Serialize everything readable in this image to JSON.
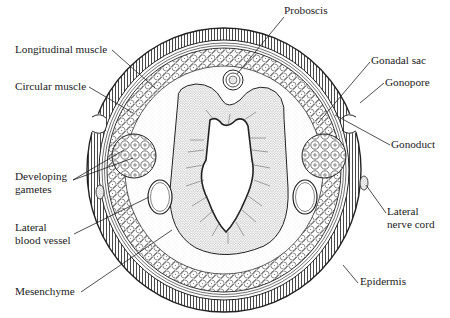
{
  "figure": {
    "type": "cross-section diagram",
    "center": [
      224,
      170
    ],
    "ink_color": "#222222",
    "background": "#ffffff"
  },
  "labels": [
    {
      "id": "proboscis",
      "text": "Proboscis",
      "x": 284,
      "y": 11,
      "line": [
        [
          284,
          17
        ],
        [
          237,
          74
        ]
      ]
    },
    {
      "id": "longitudinal-muscle",
      "text": "Longitudinal muscle",
      "x": 15,
      "y": 43,
      "line": [
        [
          112,
          50
        ],
        [
          155,
          88
        ]
      ]
    },
    {
      "id": "circular-muscle",
      "text": "Circular muscle",
      "x": 15,
      "y": 80,
      "line": [
        [
          89,
          87
        ],
        [
          133,
          113
        ]
      ]
    },
    {
      "id": "gonadal-sac",
      "text": "Gonadal sac",
      "x": 371,
      "y": 54,
      "line": [
        [
          370,
          62
        ],
        [
          318,
          123
        ]
      ]
    },
    {
      "id": "gonopore",
      "text": "Gonopore",
      "x": 385,
      "y": 76,
      "line": [
        [
          384,
          83
        ],
        [
          360,
          103
        ]
      ]
    },
    {
      "id": "gonoduct",
      "text": "Gonoduct",
      "x": 391,
      "y": 140,
      "line": [
        [
          390,
          145
        ],
        [
          335,
          115
        ]
      ]
    },
    {
      "id": "developing-gametes",
      "text": "Developing\ngametes",
      "x": 15,
      "y": 176,
      "lines": [
        [
          [
            73,
            180
          ],
          [
            124,
            150
          ]
        ],
        [
          [
            73,
            180
          ],
          [
            133,
            158
          ]
        ]
      ]
    },
    {
      "id": "lateral-blood-vessel",
      "text": "Lateral\nblood vessel",
      "x": 15,
      "y": 226,
      "line": [
        [
          74,
          234
        ],
        [
          149,
          197
        ]
      ]
    },
    {
      "id": "lateral-nerve-cord",
      "text": "Lateral\nnerve cord",
      "x": 387,
      "y": 210,
      "line": [
        [
          386,
          213
        ],
        [
          366,
          185
        ]
      ]
    },
    {
      "id": "mesenchyme",
      "text": "Mesenchyme",
      "x": 15,
      "y": 285,
      "line": [
        [
          81,
          292
        ],
        [
          172,
          230
        ]
      ]
    },
    {
      "id": "epidermis",
      "text": "Epidermis",
      "x": 360,
      "y": 275,
      "line": [
        [
          358,
          283
        ],
        [
          343,
          265
        ]
      ]
    }
  ],
  "structures": {
    "outer_body": {
      "rx": 137,
      "ry": 142
    },
    "epidermis_band": {
      "rx_in": 125,
      "ry_in": 130
    },
    "circular_muscle_band": {
      "rx_in": 119,
      "ry_in": 124
    },
    "longitudinal_muscle_band": {
      "rx_in": 99,
      "ry_in": 104
    },
    "proboscis": {
      "cx": 233,
      "cy": 80,
      "r": 10
    },
    "gonads": [
      {
        "cx": 134,
        "cy": 156,
        "rx": 22,
        "ry": 22
      },
      {
        "cx": 324,
        "cy": 156,
        "rx": 22,
        "ry": 22
      }
    ],
    "blood_vessels": [
      {
        "cx": 160,
        "cy": 197,
        "rx": 12,
        "ry": 17
      },
      {
        "cx": 305,
        "cy": 197,
        "rx": 12,
        "ry": 17
      }
    ],
    "nerve_cords": [
      {
        "cx": 99,
        "cy": 192
      },
      {
        "cx": 363,
        "cy": 183
      }
    ]
  }
}
